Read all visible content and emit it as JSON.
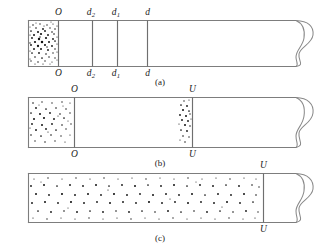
{
  "figure": {
    "title": "",
    "panels": [
      {
        "id": "a",
        "caption": "(a)",
        "top_labels": [
          "O",
          "d",
          "d",
          "d"
        ],
        "top_label_full": [
          "O",
          "d2",
          "d1",
          "d"
        ],
        "bottom_label_full": [
          "O",
          "d2",
          "d1",
          "d"
        ],
        "label_base": [
          "O",
          "d",
          "d",
          "d"
        ],
        "label_subs": [
          "",
          "2",
          "1",
          ""
        ],
        "particles_region": "left-compartment",
        "description": "Tube with particles confined to leftmost compartment; vertical partitions at O, d2, d1, d"
      },
      {
        "id": "b",
        "caption": "(b)",
        "label_base": [
          "O",
          "U"
        ],
        "label_subs": [
          "",
          ""
        ],
        "particles_region": "left-compartment-and-narrow-band-before-U",
        "description": "Tube with particles in left compartment and a narrow band just left of U"
      },
      {
        "id": "c",
        "caption": "(c)",
        "label_base": [
          "U"
        ],
        "label_subs": [
          ""
        ],
        "particles_region": "full-length-to-U",
        "description": "Tube with particles spread evenly across full length up to U"
      }
    ],
    "colors": {
      "tube_stroke": "#7d7d7d",
      "divider_stroke": "#6f6f6f",
      "break_stroke": "#8a8a8a",
      "particle": "#111111",
      "label_text": "#1b1b1b",
      "background": "#ffffff"
    },
    "symbols": {
      "break_symbol": "tube-break-squiggle"
    }
  }
}
